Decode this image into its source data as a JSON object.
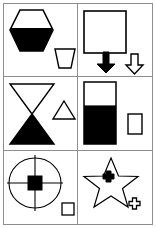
{
  "figure": {
    "title": "",
    "background_color": "#ffffff",
    "stroke_color": "#000000",
    "fill_color": "#000000",
    "grid_line_color": "#8e8e8e",
    "width": 156,
    "height": 228,
    "rows": 3,
    "columns": 2
  },
  "cells": [
    {
      "id": "cell-1",
      "position": "row1-col1",
      "shapes": [
        {
          "name": "hexagon-half-filled",
          "type": "hexagon",
          "fill": "bottom-half-black",
          "size": "large",
          "label": "hexagon"
        },
        {
          "name": "trapezoid-outline",
          "type": "trapezoid",
          "fill": "none",
          "size": "small",
          "label": "trapezoid"
        }
      ]
    },
    {
      "id": "cell-2",
      "position": "row1-col2",
      "shapes": [
        {
          "name": "square-outline",
          "type": "square",
          "fill": "none",
          "size": "large",
          "label": "square"
        },
        {
          "name": "down-arrow-filled",
          "type": "arrow-down",
          "fill": "black",
          "size": "small",
          "label": "black down arrow"
        },
        {
          "name": "down-arrow-outline",
          "type": "arrow-down",
          "fill": "none",
          "size": "small",
          "label": "white down arrow"
        }
      ]
    },
    {
      "id": "cell-3",
      "position": "row2-col1",
      "shapes": [
        {
          "name": "hourglass-half-filled",
          "type": "hourglass",
          "fill": "bottom-half-black",
          "size": "large",
          "label": "hourglass"
        },
        {
          "name": "triangle-outline",
          "type": "triangle",
          "fill": "none",
          "size": "small",
          "label": "triangle"
        }
      ]
    },
    {
      "id": "cell-4",
      "position": "row2-col2",
      "shapes": [
        {
          "name": "rectangle-half-filled",
          "type": "rectangle",
          "fill": "bottom-60-percent-black",
          "size": "large",
          "label": "rectangle"
        },
        {
          "name": "rectangle-outline",
          "type": "rectangle",
          "fill": "none",
          "size": "small",
          "label": "rectangle"
        }
      ]
    },
    {
      "id": "cell-5",
      "position": "row3-col1",
      "shapes": [
        {
          "name": "circle-crosshair",
          "type": "circle-with-crosshair",
          "fill": "none",
          "size": "large",
          "label": "circle with crosshair"
        },
        {
          "name": "square-center-filled",
          "type": "square",
          "fill": "black",
          "size": "small",
          "label": "black square"
        },
        {
          "name": "square-outline-small",
          "type": "square",
          "fill": "none",
          "size": "small",
          "label": "square"
        }
      ]
    },
    {
      "id": "cell-6",
      "position": "row3-col2",
      "shapes": [
        {
          "name": "star-outline",
          "type": "star",
          "fill": "none",
          "size": "large",
          "label": "star"
        },
        {
          "name": "cross-filled",
          "type": "cross",
          "fill": "black",
          "size": "small",
          "label": "black cross"
        },
        {
          "name": "cross-outline",
          "type": "cross",
          "fill": "none",
          "size": "small",
          "label": "cross"
        }
      ]
    }
  ]
}
